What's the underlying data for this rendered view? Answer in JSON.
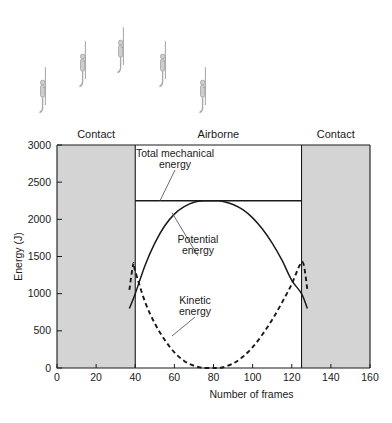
{
  "figure": {
    "zones": [
      {
        "label": "Contact",
        "from": 0,
        "to": 40
      },
      {
        "label": "Airborne",
        "from": 40,
        "to": 125
      },
      {
        "label": "Contact",
        "from": 125,
        "to": 160
      }
    ],
    "shaded_color": "#d4d4d4",
    "plot_background": "#ffffff",
    "axis_color": "#1a1a1a",
    "illustration": {
      "name": "jumper-sequence",
      "figure_count": 5,
      "figure_color": "#a8a8a8",
      "positions": [
        {
          "x": 40,
          "y": 78
        },
        {
          "x": 80,
          "y": 52
        },
        {
          "x": 118,
          "y": 38
        },
        {
          "x": 160,
          "y": 52
        },
        {
          "x": 200,
          "y": 78
        }
      ]
    }
  },
  "chart_data": {
    "type": "line",
    "title": "",
    "xlabel": "Number of frames",
    "ylabel": "Energy (J)",
    "xlim": [
      0,
      160
    ],
    "ylim": [
      0,
      3000
    ],
    "xticks": [
      0,
      20,
      40,
      60,
      80,
      100,
      120,
      140,
      160
    ],
    "yticks": [
      0,
      500,
      1000,
      1500,
      2000,
      2500,
      3000
    ],
    "grid": false,
    "legend": "inline-annotations",
    "series": [
      {
        "name": "Total mechanical energy",
        "style": "solid",
        "label_text_line1": "Total mechanical",
        "label_text_line2": "energy",
        "x": [
          40,
          125
        ],
        "values": [
          2250,
          2250
        ]
      },
      {
        "name": "Potential energy",
        "style": "solid",
        "label_text_line1": "Potential",
        "label_text_line2": "energy",
        "x": [
          37,
          40,
          45,
          50,
          55,
          60,
          65,
          70,
          75,
          80,
          82,
          85,
          90,
          95,
          100,
          105,
          110,
          115,
          120,
          125,
          128
        ],
        "values": [
          800,
          1000,
          1380,
          1680,
          1910,
          2070,
          2170,
          2230,
          2250,
          2250,
          2250,
          2240,
          2200,
          2130,
          2020,
          1870,
          1680,
          1450,
          1180,
          1000,
          800
        ]
      },
      {
        "name": "Kinetic energy",
        "style": "dashed",
        "label_text_line1": "Kinetic",
        "label_text_line2": "energy",
        "x": [
          37,
          39,
          40,
          45,
          50,
          55,
          60,
          65,
          70,
          75,
          80,
          82,
          85,
          90,
          95,
          100,
          105,
          110,
          115,
          120,
          124,
          126,
          128
        ],
        "values": [
          1050,
          1400,
          1300,
          890,
          600,
          380,
          210,
          95,
          30,
          2,
          0,
          0,
          10,
          60,
          150,
          280,
          450,
          650,
          880,
          1130,
          1380,
          1400,
          1050
        ]
      }
    ],
    "annotations": [
      {
        "text": "Total mechanical energy",
        "target_x": 60,
        "target_y": 2250
      },
      {
        "text": "Potential energy",
        "target_x": 68,
        "target_y": 2170
      },
      {
        "text": "Kinetic energy",
        "target_x": 70,
        "target_y": 420
      }
    ]
  }
}
